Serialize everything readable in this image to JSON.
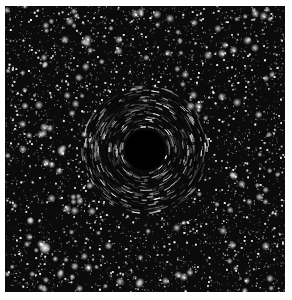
{
  "image": {
    "subject": "black hole with gravitational lensing against a dense starfield",
    "alt": "Simulated black hole lensing a field of stars",
    "background_color": "#0b0b0b",
    "border_color": "#ffffff",
    "center": [
      145,
      150
    ],
    "shadow_radius": 20,
    "lensing_ring_radius": 52,
    "bright_star": [
      45,
      248
    ]
  }
}
